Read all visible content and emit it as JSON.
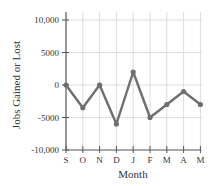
{
  "chart_data": {
    "type": "line",
    "title": "",
    "xlabel": "Month",
    "ylabel": "Jobs Gained or Lost",
    "categories": [
      "S",
      "O",
      "N",
      "D",
      "J",
      "F",
      "M",
      "A",
      "M"
    ],
    "series": [
      {
        "name": "Jobs Gained or Lost",
        "values": [
          0,
          -3500,
          0,
          -6000,
          2000,
          -5000,
          -3000,
          -1000,
          -3000
        ]
      }
    ],
    "ylim": [
      -10000,
      10000
    ],
    "yticks": [
      10000,
      5000,
      0,
      -5000,
      -10000
    ],
    "ytick_labels": [
      "10,000",
      "5000",
      "0",
      "-5000",
      "-10,000"
    ],
    "grid": true,
    "legend": "none",
    "colors": {
      "line": "#6e6e6e",
      "marker": "#6e6e6e",
      "grid": "#dddddd",
      "axis": "#555555"
    }
  }
}
